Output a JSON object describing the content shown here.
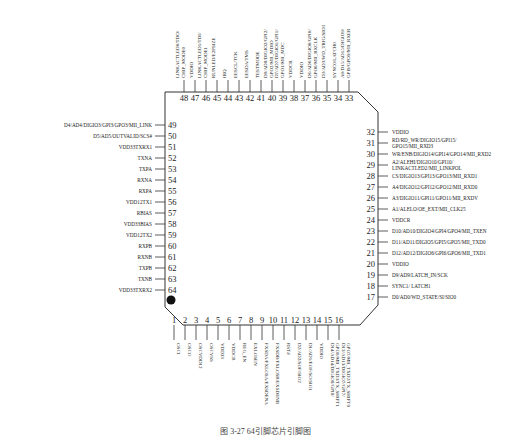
{
  "diagram": {
    "caption": "图 3-27  64引脚芯片引脚图",
    "pin1_marker": "filled-dot",
    "colors": {
      "line": "#333333",
      "text": "#222222",
      "background": "#ffffff"
    },
    "pins": {
      "bottom": [
        {
          "num": "1",
          "label": "OSCI"
        },
        {
          "num": "2",
          "label": "OSCO"
        },
        {
          "num": "3",
          "label": "OSCVDD12"
        },
        {
          "num": "4",
          "label": "OSCVSS"
        },
        {
          "num": "5",
          "label": "VDD33"
        },
        {
          "num": "6",
          "label": "VDDCR"
        },
        {
          "num": "7",
          "label": "REG_EN"
        },
        {
          "num": "8",
          "label": "EXLOSEN"
        },
        {
          "num": "9",
          "label": "FXSDA/FXLOSA/EXSDENA"
        },
        {
          "num": "10",
          "label": "FXSDB/FXLOSB/EXSDENB"
        },
        {
          "num": "11",
          "label": "RST#"
        },
        {
          "num": "12",
          "label": "D2/AD2/SOF/SIO2"
        },
        {
          "num": "13",
          "label": "D1/AD1/EOF/SO/SIO1"
        },
        {
          "num": "14",
          "label": "VDDIO"
        },
        {
          "num": "15",
          "label": "D14/AD14/DIGIO8/GPI8/ GPO8/MII_TXD3/TX_SHIFT1"
        },
        {
          "num": "16",
          "label": "D13/AD13/DIGIO7/GPI7/ GPO7/MII_TXD2/TX_SHIFT0"
        }
      ],
      "right": [
        {
          "num": "17",
          "label": "D0/AD0/WD_STATE/SI/SIO0"
        },
        {
          "num": "18",
          "label": "SYNC1/ LATCH1"
        },
        {
          "num": "19",
          "label": "D9/AD9/LATCH_IN/SCK"
        },
        {
          "num": "20",
          "label": "VDDIO"
        },
        {
          "num": "21",
          "label": "D12/AD12/DIGIO6/GPI6/GPO6/MII_TXD1"
        },
        {
          "num": "22",
          "label": "D11/AD11/DIGIO5/GPI5/GPO5/MII_TXD0"
        },
        {
          "num": "23",
          "label": "D10/AD10/DIGIO4/GPI4/GPO4/MII_TXEN"
        },
        {
          "num": "24",
          "label": "VDDCR"
        },
        {
          "num": "25",
          "label": "A1/ALELO/OE_EXT/MII_CLK25"
        },
        {
          "num": "26",
          "label": "A3/DIGIO11/GPI11/GPO11/MII_RXDV"
        },
        {
          "num": "27",
          "label": "A4/DIGIO12/GPI12/GPO12/MII_RXD0"
        },
        {
          "num": "28",
          "label": "CS/DIGIO13/GPI13/GPO13/MII_RXD1"
        },
        {
          "num": "29",
          "label": "A2/ALEHI/DIGIO10/GPI10/",
          "label2": "LINKACTLED2/MII_LINKPOL"
        },
        {
          "num": "30",
          "label": "WR/ENB/DIGIO14/GPI14/GPO14/MII_RXD2"
        },
        {
          "num": "31",
          "label": "RD/RD_WR/DIGIO15/GPI15/",
          "label2": "GPO15/MII_RXD3"
        },
        {
          "num": "32",
          "label": "VDDIO"
        }
      ],
      "top": [
        {
          "num": "33",
          "label": "A0/D15/AD15/DIGIO9/ GPI9/GPO9/MII_RXER"
        },
        {
          "num": "34",
          "label": "SYNC0/LATCH0"
        },
        {
          "num": "35",
          "label": "D3/AD3/WD_TRIG/SIO3"
        },
        {
          "num": "36",
          "label": "D6/AD6/DIGIO0/GPI0/ GPO0/MII_RXCLK"
        },
        {
          "num": "37",
          "label": "VDDIO"
        },
        {
          "num": "38",
          "label": "VDDCR"
        },
        {
          "num": "39",
          "label": "D7/AD7/DIGIO1/GPI1/ GPO1/MII_MDC"
        },
        {
          "num": "40",
          "label": "D8/AD8/DIGIO2/GPI2/ GPO2/MII_MDIO"
        },
        {
          "num": "41",
          "label": "TESTMODE"
        },
        {
          "num": "42",
          "label": "EESDA/TMS"
        },
        {
          "num": "43",
          "label": "EESCL/TCK"
        },
        {
          "num": "44",
          "label": "IRQ"
        },
        {
          "num": "45",
          "label": "RUNLED/E2PSIZE"
        },
        {
          "num": "46",
          "label": "LINKACTLED1/TDI/ CHIP_MODE1"
        },
        {
          "num": "47",
          "label": "VDDIO"
        },
        {
          "num": "48",
          "label": "LINKACTLED0/TDO/ CHIP_MODE0"
        }
      ],
      "left": [
        {
          "num": "49",
          "label": "D4/AD4/DIGIO3/GPI3/GPO3/MII_LINK"
        },
        {
          "num": "50",
          "label": "D5/AD5/OUTVALID/SCS#"
        },
        {
          "num": "51",
          "label": "VDD33TXRX1"
        },
        {
          "num": "52",
          "label": "TXNA"
        },
        {
          "num": "53",
          "label": "TXPA"
        },
        {
          "num": "54",
          "label": "RXNA"
        },
        {
          "num": "55",
          "label": "RXPA"
        },
        {
          "num": "56",
          "label": "VDD12TX1"
        },
        {
          "num": "57",
          "label": "RBIAS"
        },
        {
          "num": "58",
          "label": "VDD33BIAS"
        },
        {
          "num": "59",
          "label": "VDD12TX2"
        },
        {
          "num": "60",
          "label": "RXPB"
        },
        {
          "num": "61",
          "label": "RXNB"
        },
        {
          "num": "62",
          "label": "TXPB"
        },
        {
          "num": "63",
          "label": "TXNB"
        },
        {
          "num": "64",
          "label": "VDD33TXRX2"
        }
      ]
    }
  }
}
